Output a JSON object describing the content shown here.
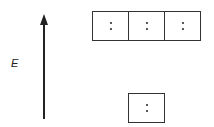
{
  "diagram": {
    "type": "orbital-energy-level-diagram",
    "axis": {
      "label": "E",
      "direction": "up"
    },
    "levels": [
      {
        "name": "upper-level",
        "orbitals": [
          {
            "electrons": 2
          },
          {
            "electrons": 2
          },
          {
            "electrons": 2
          }
        ]
      },
      {
        "name": "lower-level",
        "orbitals": [
          {
            "electrons": 2
          }
        ]
      }
    ]
  }
}
